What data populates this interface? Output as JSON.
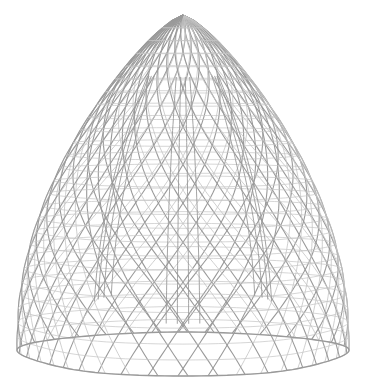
{
  "image": {
    "subject": "3D wireframe surface with rounded triangular dome shape and inner cusped lobes",
    "background": "#ffffff",
    "line_color": "#9a9a9a",
    "line_color_light": "#c4c4c4",
    "apex": [
      183,
      15
    ],
    "base_left": [
      20,
      330
    ],
    "base_right": [
      346,
      330
    ],
    "base_bottom_y": 376,
    "meridians": 36,
    "parallels": 26
  }
}
